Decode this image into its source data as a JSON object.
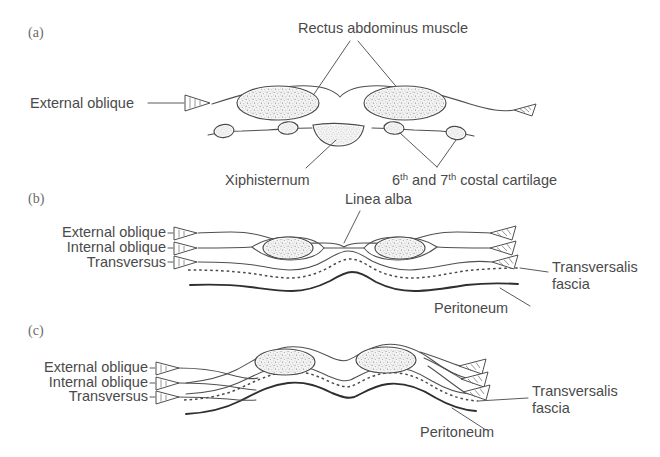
{
  "figure": {
    "background_color": "#ffffff",
    "ink_color": "#4a4a4a",
    "muscle_fill_color": "#efefef"
  },
  "panels": [
    {
      "id": "a",
      "tag": "(a)",
      "labels": {
        "rectus": "Rectus abdominus muscle",
        "external_oblique": "External oblique",
        "xiphisternum": "Xiphisternum",
        "costal_cartilage_prefix": "6",
        "costal_cartilage_sup1": "th",
        "costal_cartilage_mid": " and 7",
        "costal_cartilage_sup2": "th",
        "costal_cartilage_suffix": " costal cartilage"
      }
    },
    {
      "id": "b",
      "tag": "(b)",
      "labels": {
        "linea_alba": "Linea alba",
        "external_oblique": "External oblique",
        "internal_oblique": "Internal oblique",
        "transversus": "Transversus",
        "transversalis_line1": "Transversalis",
        "transversalis_line2": "fascia",
        "peritoneum": "Peritoneum"
      }
    },
    {
      "id": "c",
      "tag": "(c)",
      "labels": {
        "external_oblique": "External oblique",
        "internal_oblique": "Internal oblique",
        "transversus": "Transversus",
        "transversalis_line1": "Transversalis",
        "transversalis_line2": "fascia",
        "peritoneum": "Peritoneum"
      }
    }
  ]
}
